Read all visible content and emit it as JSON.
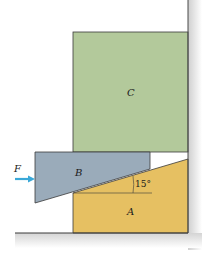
{
  "diagram": {
    "labels": {
      "block_c": "C",
      "block_b": "B",
      "block_a": "A",
      "force": "F",
      "angle": "15°"
    },
    "colors": {
      "block_c": "#b3c99b",
      "block_b": "#9aabba",
      "block_a": "#e6c062",
      "force_arrow": "#3aa8d8",
      "outline": "#3a3a3a",
      "wall_shadow": "#d8d8d8"
    },
    "angle_degrees": 15
  }
}
